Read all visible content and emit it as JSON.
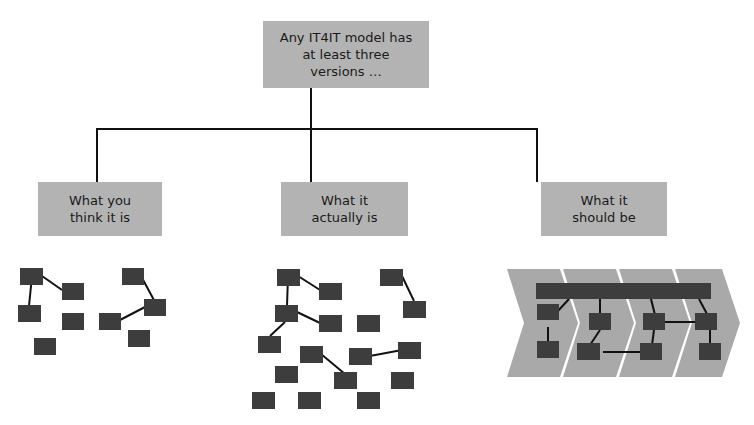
{
  "diagram": {
    "root": {
      "label": "Any IT4IT model has\nat least three\nversions …"
    },
    "children": [
      {
        "label": "What you\nthink it is"
      },
      {
        "label": "What it\nactually is"
      },
      {
        "label": "What it\nshould be"
      }
    ]
  },
  "colors": {
    "box_fill": "#b3b3b3",
    "node_fill": "#3d3d3d",
    "chevron_fill": "#a9a9a9",
    "line": "#111111"
  }
}
